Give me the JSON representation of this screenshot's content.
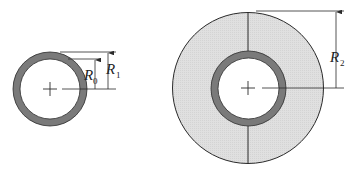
{
  "figure": {
    "colors": {
      "background": "#ffffff",
      "ring": "#7a7a7a",
      "insulation": "#dedede",
      "line": "#2a2a2a"
    },
    "left_pipe": {
      "labels": [
        {
          "symbol": "R",
          "subscript": "0"
        },
        {
          "symbol": "R",
          "subscript": "1"
        }
      ]
    },
    "right_pipe": {
      "labels": [
        {
          "symbol": "R",
          "subscript": "2"
        }
      ]
    }
  }
}
